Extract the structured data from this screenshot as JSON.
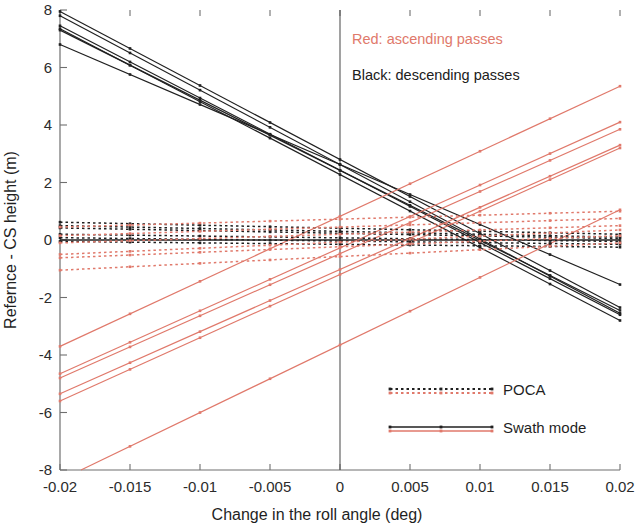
{
  "chart_data": {
    "type": "line",
    "title": "",
    "xlabel": "Change in the roll angle (deg)",
    "ylabel": "Refernce - CS height (m)",
    "xlim": [
      -0.02,
      0.02
    ],
    "ylim": [
      -8,
      8
    ],
    "xticks": [
      -0.02,
      -0.015,
      -0.01,
      -0.005,
      0,
      0.005,
      0.01,
      0.015,
      0.02
    ],
    "xticklabels": [
      "-0.02",
      "-0.015",
      "-0.01",
      "-0.005",
      "0",
      "0.005",
      "0.01",
      "0.015",
      "0.02"
    ],
    "yticks": [
      -8,
      -6,
      -4,
      -2,
      0,
      2,
      4,
      6,
      8
    ],
    "yticklabels": [
      "-8",
      "-6",
      "-4",
      "-2",
      "0",
      "2",
      "4",
      "6",
      "8"
    ],
    "grid": false,
    "reference_lines": [
      {
        "name": "vertical-zero",
        "orientation": "vertical",
        "value": 0,
        "color": "#555555"
      },
      {
        "name": "horizontal-zero",
        "orientation": "horizontal",
        "value": 0,
        "color": "#222222"
      }
    ],
    "marker": "dot",
    "marker_x": [
      -0.02,
      -0.015,
      -0.01,
      -0.005,
      0,
      0.005,
      0.01,
      0.015,
      0.02
    ],
    "annotations": [
      {
        "text": "Red: ascending passes",
        "x": 0.001,
        "y": 6.85,
        "color": "#E0796B"
      },
      {
        "text": "Black: descending passes",
        "x": 0.001,
        "y": 5.6,
        "color": "#202020"
      }
    ],
    "legend": {
      "position": "lower-right",
      "entries": [
        {
          "label": "POCA",
          "style": "dotted",
          "colors": [
            "#202020",
            "#E0796B"
          ]
        },
        {
          "label": "Swath mode",
          "style": "solid",
          "colors": [
            "#202020",
            "#E0796B"
          ]
        }
      ]
    },
    "series": [
      {
        "name": "descending-swath-1",
        "group": "descending",
        "mode": "swath",
        "style": "solid",
        "color": "#202020",
        "x": [
          -0.02,
          0.02
        ],
        "y": [
          7.95,
          -2.35
        ]
      },
      {
        "name": "descending-swath-2",
        "group": "descending",
        "mode": "swath",
        "style": "solid",
        "color": "#202020",
        "x": [
          -0.02,
          0.02
        ],
        "y": [
          7.8,
          -2.55
        ]
      },
      {
        "name": "descending-swath-3",
        "group": "descending",
        "mode": "swath",
        "style": "solid",
        "color": "#202020",
        "x": [
          -0.02,
          0.02
        ],
        "y": [
          7.45,
          -2.6
        ]
      },
      {
        "name": "descending-swath-4",
        "group": "descending",
        "mode": "swath",
        "style": "solid",
        "color": "#202020",
        "x": [
          -0.02,
          0.02
        ],
        "y": [
          7.35,
          -2.8
        ]
      },
      {
        "name": "descending-swath-5",
        "group": "descending",
        "mode": "swath",
        "style": "solid",
        "color": "#202020",
        "x": [
          -0.02,
          0.02
        ],
        "y": [
          7.3,
          -2.45
        ]
      },
      {
        "name": "descending-swath-6",
        "group": "descending",
        "mode": "swath",
        "style": "solid",
        "color": "#202020",
        "x": [
          -0.02,
          0.02
        ],
        "y": [
          6.8,
          -1.55
        ]
      },
      {
        "name": "ascending-swath-1",
        "group": "ascending",
        "mode": "swath",
        "style": "solid",
        "color": "#E0796B",
        "x": [
          -0.02,
          0.02
        ],
        "y": [
          -3.7,
          5.35
        ]
      },
      {
        "name": "ascending-swath-2",
        "group": "ascending",
        "mode": "swath",
        "style": "solid",
        "color": "#E0796B",
        "x": [
          -0.02,
          0.02
        ],
        "y": [
          -4.65,
          4.1
        ]
      },
      {
        "name": "ascending-swath-3",
        "group": "ascending",
        "mode": "swath",
        "style": "solid",
        "color": "#E0796B",
        "x": [
          -0.02,
          0.02
        ],
        "y": [
          -4.8,
          3.85
        ]
      },
      {
        "name": "ascending-swath-4",
        "group": "ascending",
        "mode": "swath",
        "style": "solid",
        "color": "#E0796B",
        "x": [
          -0.02,
          0.02
        ],
        "y": [
          -5.35,
          3.3
        ]
      },
      {
        "name": "ascending-swath-5",
        "group": "ascending",
        "mode": "swath",
        "style": "solid",
        "color": "#E0796B",
        "x": [
          -0.02,
          0.02
        ],
        "y": [
          -5.6,
          3.2
        ]
      },
      {
        "name": "ascending-swath-6",
        "group": "ascending",
        "mode": "swath",
        "style": "solid",
        "color": "#E0796B",
        "x": [
          -0.0185,
          0.02
        ],
        "y": [
          -8.0,
          1.05
        ]
      },
      {
        "name": "descending-poca-1",
        "group": "descending",
        "mode": "poca",
        "style": "dotted",
        "color": "#202020",
        "x": [
          -0.02,
          0.02
        ],
        "y": [
          0.62,
          0.2
        ]
      },
      {
        "name": "descending-poca-2",
        "group": "descending",
        "mode": "poca",
        "style": "dotted",
        "color": "#202020",
        "x": [
          -0.02,
          0.02
        ],
        "y": [
          0.5,
          0.1
        ]
      },
      {
        "name": "descending-poca-3",
        "group": "descending",
        "mode": "poca",
        "style": "dotted",
        "color": "#202020",
        "x": [
          -0.02,
          0.02
        ],
        "y": [
          0.42,
          0.05
        ]
      },
      {
        "name": "descending-poca-4",
        "group": "descending",
        "mode": "poca",
        "style": "dotted",
        "color": "#202020",
        "x": [
          -0.02,
          0.02
        ],
        "y": [
          0.2,
          -0.05
        ]
      },
      {
        "name": "descending-poca-5",
        "group": "descending",
        "mode": "poca",
        "style": "dotted",
        "color": "#202020",
        "x": [
          -0.02,
          0.02
        ],
        "y": [
          0.08,
          -0.15
        ]
      },
      {
        "name": "descending-poca-6",
        "group": "descending",
        "mode": "poca",
        "style": "dotted",
        "color": "#202020",
        "x": [
          -0.02,
          0.02
        ],
        "y": [
          -0.05,
          -0.25
        ]
      },
      {
        "name": "ascending-poca-1",
        "group": "ascending",
        "mode": "poca",
        "style": "dotted",
        "color": "#E0796B",
        "x": [
          -0.02,
          0.02
        ],
        "y": [
          0.45,
          1.0
        ]
      },
      {
        "name": "ascending-poca-2",
        "group": "ascending",
        "mode": "poca",
        "style": "dotted",
        "color": "#E0796B",
        "x": [
          -0.02,
          0.02
        ],
        "y": [
          0.15,
          0.75
        ]
      },
      {
        "name": "ascending-poca-3",
        "group": "ascending",
        "mode": "poca",
        "style": "dotted",
        "color": "#E0796B",
        "x": [
          -0.02,
          0.02
        ],
        "y": [
          -0.1,
          0.5
        ]
      },
      {
        "name": "ascending-poca-4",
        "group": "ascending",
        "mode": "poca",
        "style": "dotted",
        "color": "#E0796B",
        "x": [
          -0.02,
          0.02
        ],
        "y": [
          -0.5,
          0.35
        ]
      },
      {
        "name": "ascending-poca-5",
        "group": "ascending",
        "mode": "poca",
        "style": "dotted",
        "color": "#E0796B",
        "x": [
          -0.02,
          0.02
        ],
        "y": [
          -0.62,
          0.15
        ]
      },
      {
        "name": "ascending-poca-6",
        "group": "ascending",
        "mode": "poca",
        "style": "dotted",
        "color": "#E0796B",
        "x": [
          -0.02,
          0.02
        ],
        "y": [
          -1.05,
          -0.1
        ]
      }
    ]
  },
  "plot": {
    "x_axis_title": "Change in the roll angle (deg)",
    "y_axis_title": "Refernce - CS height (m)"
  },
  "annotations": {
    "ascending": "Red: ascending passes",
    "descending": "Black: descending passes"
  },
  "legend": {
    "poca_label": "POCA",
    "swath_label": "Swath mode"
  },
  "colors": {
    "red": "#E0796B",
    "black": "#202020",
    "axis": "#6f6f6f"
  }
}
